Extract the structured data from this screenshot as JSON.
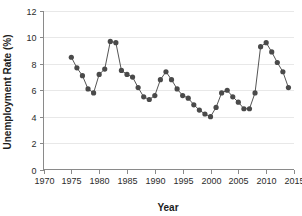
{
  "chart_data": {
    "type": "line",
    "title": "",
    "xlabel": "Year",
    "ylabel": "Unemployment Rate (%)",
    "xlim": [
      1970,
      2015
    ],
    "ylim": [
      0,
      12
    ],
    "xticks": [
      1970,
      1975,
      1980,
      1985,
      1990,
      1995,
      2000,
      2005,
      2010,
      2015
    ],
    "yticks": [
      0,
      2,
      4,
      6,
      8,
      10,
      12
    ],
    "grid": true,
    "grid_axis": "y",
    "legend": "none",
    "marker": "filled-circle",
    "marker_color": "#4a4a4a",
    "line_color": "#555555",
    "x": [
      1975,
      1976,
      1977,
      1978,
      1979,
      1980,
      1981,
      1982,
      1983,
      1984,
      1985,
      1986,
      1987,
      1988,
      1989,
      1990,
      1991,
      1992,
      1993,
      1994,
      1995,
      1996,
      1997,
      1998,
      1999,
      2000,
      2001,
      2002,
      2003,
      2004,
      2005,
      2006,
      2007,
      2008,
      2009,
      2010,
      2011,
      2012,
      2013,
      2014
    ],
    "values": [
      8.5,
      7.7,
      7.1,
      6.1,
      5.8,
      7.2,
      7.6,
      9.7,
      9.6,
      7.5,
      7.2,
      7.0,
      6.2,
      5.5,
      5.3,
      5.6,
      6.8,
      7.4,
      6.8,
      6.1,
      5.6,
      5.4,
      4.9,
      4.5,
      4.2,
      4.0,
      4.7,
      5.8,
      6.0,
      5.5,
      5.1,
      4.6,
      4.6,
      5.8,
      9.3,
      9.6,
      8.9,
      8.1,
      7.4,
      6.2
    ],
    "axis_tick_labels": {
      "x": [
        "1970",
        "1975",
        "1980",
        "1985",
        "1990",
        "1995",
        "2000",
        "2005",
        "2010",
        "2015"
      ],
      "y": [
        "0",
        "2",
        "4",
        "6",
        "8",
        "10",
        "12"
      ]
    }
  }
}
